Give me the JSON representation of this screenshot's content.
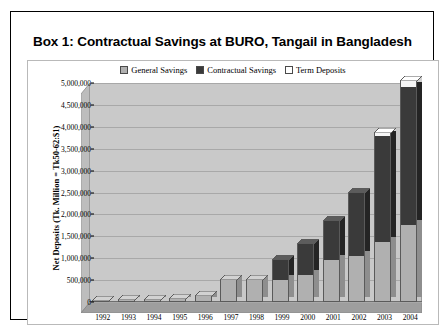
{
  "box": {
    "title": "Box 1: Contractual Savings at BURO, Tangail in Bangladesh"
  },
  "chart_data": {
    "type": "bar",
    "subtype": "stacked-3d-column",
    "title": "",
    "xlabel": "",
    "ylabel": "Net Deposits (Tk. Million = Tk50-62:$1)",
    "ylim": [
      0,
      5000000
    ],
    "ytick_labels": [
      "5,000,000",
      "4,500,000",
      "4,000,000",
      "3,500,000",
      "3,000,000",
      "2,500,000",
      "2,000,000",
      "1,500,000",
      "1,000,000",
      "500,000",
      "0"
    ],
    "ytick_values": [
      5000000,
      4500000,
      4000000,
      3500000,
      3000000,
      2500000,
      2000000,
      1500000,
      1000000,
      500000,
      0
    ],
    "grid": true,
    "legend_position": "top-center",
    "categories": [
      "1992",
      "1993",
      "1994",
      "1995",
      "1996",
      "1997",
      "1998",
      "1999",
      "2000",
      "2001",
      "2002",
      "2003",
      "2004"
    ],
    "series": [
      {
        "name": "General Savings",
        "color": "#b0b0b0",
        "values": [
          30000,
          40000,
          55000,
          80000,
          135000,
          500000,
          495000,
          500000,
          620000,
          950000,
          1050000,
          1380000,
          1750000
        ]
      },
      {
        "name": "Contractual Savings",
        "color": "#3a3a3a",
        "values": [
          0,
          0,
          0,
          0,
          0,
          0,
          0,
          450000,
          700000,
          900000,
          1450000,
          2400000,
          3150000
        ]
      },
      {
        "name": "Term Deposits",
        "color": "#f5f5f5",
        "values": [
          0,
          0,
          0,
          0,
          0,
          0,
          0,
          0,
          0,
          0,
          0,
          70000,
          150000
        ]
      }
    ],
    "totals": [
      30000,
      40000,
      55000,
      80000,
      135000,
      500000,
      495000,
      950000,
      1320000,
      1850000,
      2500000,
      3850000,
      5050000
    ]
  },
  "legend": {
    "items": [
      {
        "label": "General Savings",
        "swatch": "#b0b0b0"
      },
      {
        "label": "Contractual Savings",
        "swatch": "#3a3a3a"
      },
      {
        "label": "Term Deposits",
        "swatch": "#ffffff"
      }
    ]
  }
}
